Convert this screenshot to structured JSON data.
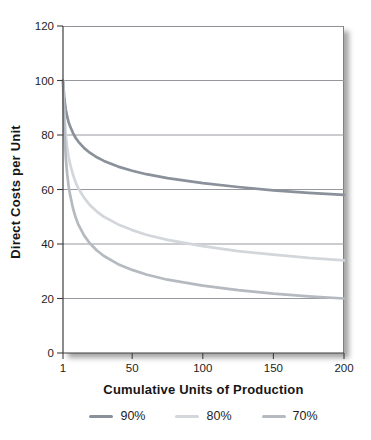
{
  "chart_data": {
    "type": "line",
    "title": "",
    "xlabel": "Cumulative Units of Production",
    "ylabel": "Direct Costs per Unit",
    "xlim": [
      1,
      200
    ],
    "ylim": [
      0,
      120
    ],
    "x_ticks": [
      1,
      50,
      100,
      150,
      200
    ],
    "y_ticks": [
      0,
      20,
      40,
      60,
      80,
      100,
      120
    ],
    "grid": "horizontal",
    "legend_position": "bottom",
    "frame_shadow": true,
    "colors": {
      "gridline": "#95999e",
      "axis": "#3f3f3f",
      "tick": "#3f3f3f",
      "text": "#1d1d1d"
    },
    "x": [
      1,
      2,
      3,
      4,
      5,
      6,
      8,
      10,
      12,
      16,
      20,
      25,
      30,
      40,
      50,
      60,
      75,
      100,
      125,
      150,
      175,
      200
    ],
    "series": [
      {
        "name": "90%",
        "color": "#8b919b",
        "values": [
          100,
          93.1,
          89.3,
          86.7,
          84.7,
          83.2,
          80.8,
          78.9,
          77.5,
          75.2,
          73.5,
          71.8,
          70.5,
          68.4,
          66.9,
          65.6,
          64.2,
          62.3,
          60.9,
          59.7,
          58.8,
          58
        ]
      },
      {
        "name": "80%",
        "color": "#d3d6da",
        "values": [
          100,
          86.8,
          80,
          75.4,
          72.1,
          69.4,
          65.5,
          62.6,
          60.3,
          56.9,
          54.3,
          51.9,
          50,
          47.2,
          45.1,
          43.4,
          41.5,
          39.2,
          37.4,
          36.1,
          34.9,
          34
        ]
      },
      {
        "name": "70%",
        "color": "#b5bac0",
        "values": [
          100,
          81,
          71.6,
          65.6,
          61.3,
          58,
          53.2,
          49.7,
          47,
          43.1,
          40.3,
          37.6,
          35.6,
          32.6,
          30.5,
          28.8,
          26.9,
          24.7,
          23.1,
          21.8,
          20.8,
          20
        ]
      }
    ]
  }
}
